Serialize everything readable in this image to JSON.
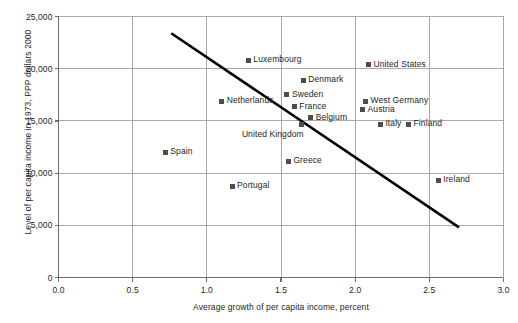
{
  "chart_data": {
    "type": "scatter",
    "title": "",
    "xlabel": "Average growth of per capita income, percent",
    "ylabel": "Level of per capita income in 1973, PPP dollars 2000",
    "xlim": [
      0.0,
      3.0
    ],
    "ylim": [
      0,
      25000
    ],
    "xticks": [
      "0.0",
      "0.5",
      "1.0",
      "1.5",
      "2.0",
      "2.5",
      "3.0"
    ],
    "xtick_values": [
      0.0,
      0.5,
      1.0,
      1.5,
      2.0,
      2.5,
      3.0
    ],
    "yticks": [
      "0",
      "5,000",
      "10,000",
      "15,000",
      "20,000",
      "25,000"
    ],
    "ytick_values": [
      0,
      5000,
      10000,
      15000,
      20000,
      25000
    ],
    "grid": true,
    "legend": "none",
    "marker_color": "#4d4d4d",
    "trendline_color": "#000000",
    "points": [
      {
        "label": "Luxembourg",
        "x": 1.28,
        "y": 20800,
        "label_pos": "right"
      },
      {
        "label": "United States",
        "x": 2.09,
        "y": 20400,
        "label_pos": "right"
      },
      {
        "label": "Denmark",
        "x": 1.65,
        "y": 18900,
        "label_pos": "right"
      },
      {
        "label": "Sweden",
        "x": 1.54,
        "y": 17500,
        "label_pos": "right"
      },
      {
        "label": "Netherlands",
        "x": 1.1,
        "y": 16900,
        "label_pos": "right"
      },
      {
        "label": "France",
        "x": 1.59,
        "y": 16350,
        "label_pos": "right"
      },
      {
        "label": "West Germany",
        "x": 2.07,
        "y": 16900,
        "label_pos": "right"
      },
      {
        "label": "Austria",
        "x": 2.05,
        "y": 16050,
        "label_pos": "right"
      },
      {
        "label": "Belgium",
        "x": 1.7,
        "y": 15300,
        "label_pos": "right"
      },
      {
        "label": "Italy",
        "x": 2.17,
        "y": 14700,
        "label_pos": "right"
      },
      {
        "label": "Finland",
        "x": 2.36,
        "y": 14700,
        "label_pos": "right"
      },
      {
        "label": "United Kingdom",
        "x": 1.64,
        "y": 14650,
        "label_pos": "below-left"
      },
      {
        "label": "Spain",
        "x": 0.72,
        "y": 12000,
        "label_pos": "right"
      },
      {
        "label": "Greece",
        "x": 1.55,
        "y": 11150,
        "label_pos": "right"
      },
      {
        "label": "Portugal",
        "x": 1.17,
        "y": 8750,
        "label_pos": "right"
      },
      {
        "label": "Ireland",
        "x": 2.56,
        "y": 9300,
        "label_pos": "right"
      }
    ],
    "trendline": {
      "x1": 0.76,
      "y1": 23400,
      "x2": 2.7,
      "y2": 4800
    }
  }
}
